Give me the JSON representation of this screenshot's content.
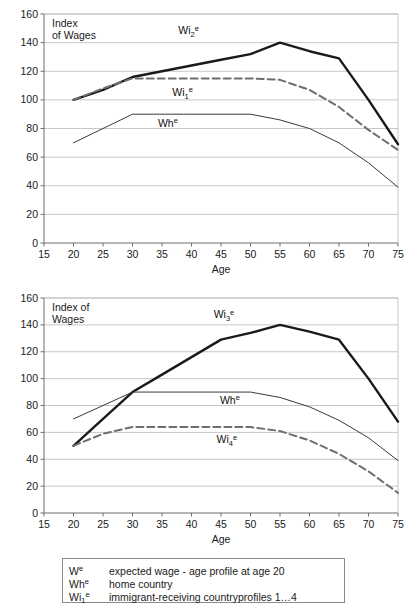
{
  "chart_data": [
    {
      "type": "line",
      "title": "Index\nof Wages",
      "title_lines": [
        "Index",
        "of Wages"
      ],
      "xlabel": "Age",
      "ylabel": "Index of Wages",
      "xlim": [
        15,
        75
      ],
      "ylim": [
        0,
        160
      ],
      "xticks": [
        15,
        20,
        25,
        30,
        35,
        40,
        45,
        50,
        55,
        60,
        65,
        70,
        75
      ],
      "yticks": [
        0,
        20,
        40,
        60,
        80,
        100,
        120,
        140,
        160
      ],
      "grid": "horizontal",
      "legend_position": "inline-annotations",
      "x": [
        20,
        25,
        30,
        35,
        40,
        45,
        50,
        55,
        60,
        65,
        70,
        75
      ],
      "series": [
        {
          "name": "Wi2e",
          "label_main": "Wi",
          "label_sub": "2",
          "label_sup": "e",
          "style": "thick-solid",
          "color": "#1a1a1a",
          "values": [
            100,
            107,
            116,
            120,
            124,
            128,
            132,
            140,
            134,
            129,
            100,
            69
          ]
        },
        {
          "name": "Wi1e",
          "label_main": "Wi",
          "label_sub": "1",
          "label_sup": "e",
          "style": "dashed",
          "color": "#6e6e6e",
          "values": [
            100,
            108,
            115,
            115,
            115,
            115,
            115,
            114,
            107,
            95,
            79,
            65
          ]
        },
        {
          "name": "Whe",
          "label_main": "Wh",
          "label_sub": "",
          "label_sup": "e",
          "style": "thin-solid",
          "color": "#3a3a3a",
          "values": [
            70,
            80,
            90,
            90,
            90,
            90,
            90,
            86,
            80,
            70,
            56,
            39
          ]
        }
      ]
    },
    {
      "type": "line",
      "title": "Index of\nWages",
      "title_lines": [
        "Index of",
        "Wages"
      ],
      "xlabel": "Age",
      "ylabel": "Index of Wages",
      "xlim": [
        15,
        75
      ],
      "ylim": [
        0,
        160
      ],
      "xticks": [
        15,
        20,
        25,
        30,
        35,
        40,
        45,
        50,
        55,
        60,
        65,
        70,
        75
      ],
      "yticks": [
        0,
        20,
        40,
        60,
        80,
        100,
        120,
        140,
        160
      ],
      "grid": "horizontal",
      "legend_position": "inline-annotations",
      "x": [
        20,
        25,
        30,
        35,
        40,
        45,
        50,
        55,
        60,
        65,
        70,
        75
      ],
      "series": [
        {
          "name": "Wi3e",
          "label_main": "Wi",
          "label_sub": "3",
          "label_sup": "e",
          "style": "thick-solid",
          "color": "#1a1a1a",
          "values": [
            50,
            70,
            90,
            103,
            116,
            129,
            134,
            140,
            135,
            129,
            100,
            68
          ]
        },
        {
          "name": "Whe",
          "label_main": "Wh",
          "label_sub": "",
          "label_sup": "e",
          "style": "thin-solid",
          "color": "#3a3a3a",
          "values": [
            70,
            80,
            90,
            90,
            90,
            90,
            90,
            86,
            79,
            69,
            56,
            39
          ]
        },
        {
          "name": "Wi4e",
          "label_main": "Wi",
          "label_sub": "4",
          "label_sup": "e",
          "style": "dashed",
          "color": "#6e6e6e",
          "values": [
            50,
            59,
            64,
            64,
            64,
            64,
            64,
            61,
            54,
            44,
            31,
            15
          ]
        }
      ]
    }
  ],
  "legend": {
    "rows": [
      {
        "symbol_main": "W",
        "symbol_sub": "",
        "symbol_sup": "e",
        "description": "expected wage - age profile at age 20"
      },
      {
        "symbol_main": "Wh",
        "symbol_sub": "",
        "symbol_sup": "e",
        "description": "home country"
      },
      {
        "symbol_main": "Wi",
        "symbol_sub": "1",
        "symbol_sup": "e",
        "description": "immigrant-receiving countryprofiles 1…4"
      }
    ]
  },
  "colors": {
    "grid": "#b9b9b9",
    "axis": "#6f6f6f",
    "thick_line": "#1a1a1a",
    "dashed_line": "#6e6e6e",
    "thin_line": "#3a3a3a",
    "text": "#1a1a1a",
    "legend_border": "#8a8a8a"
  }
}
